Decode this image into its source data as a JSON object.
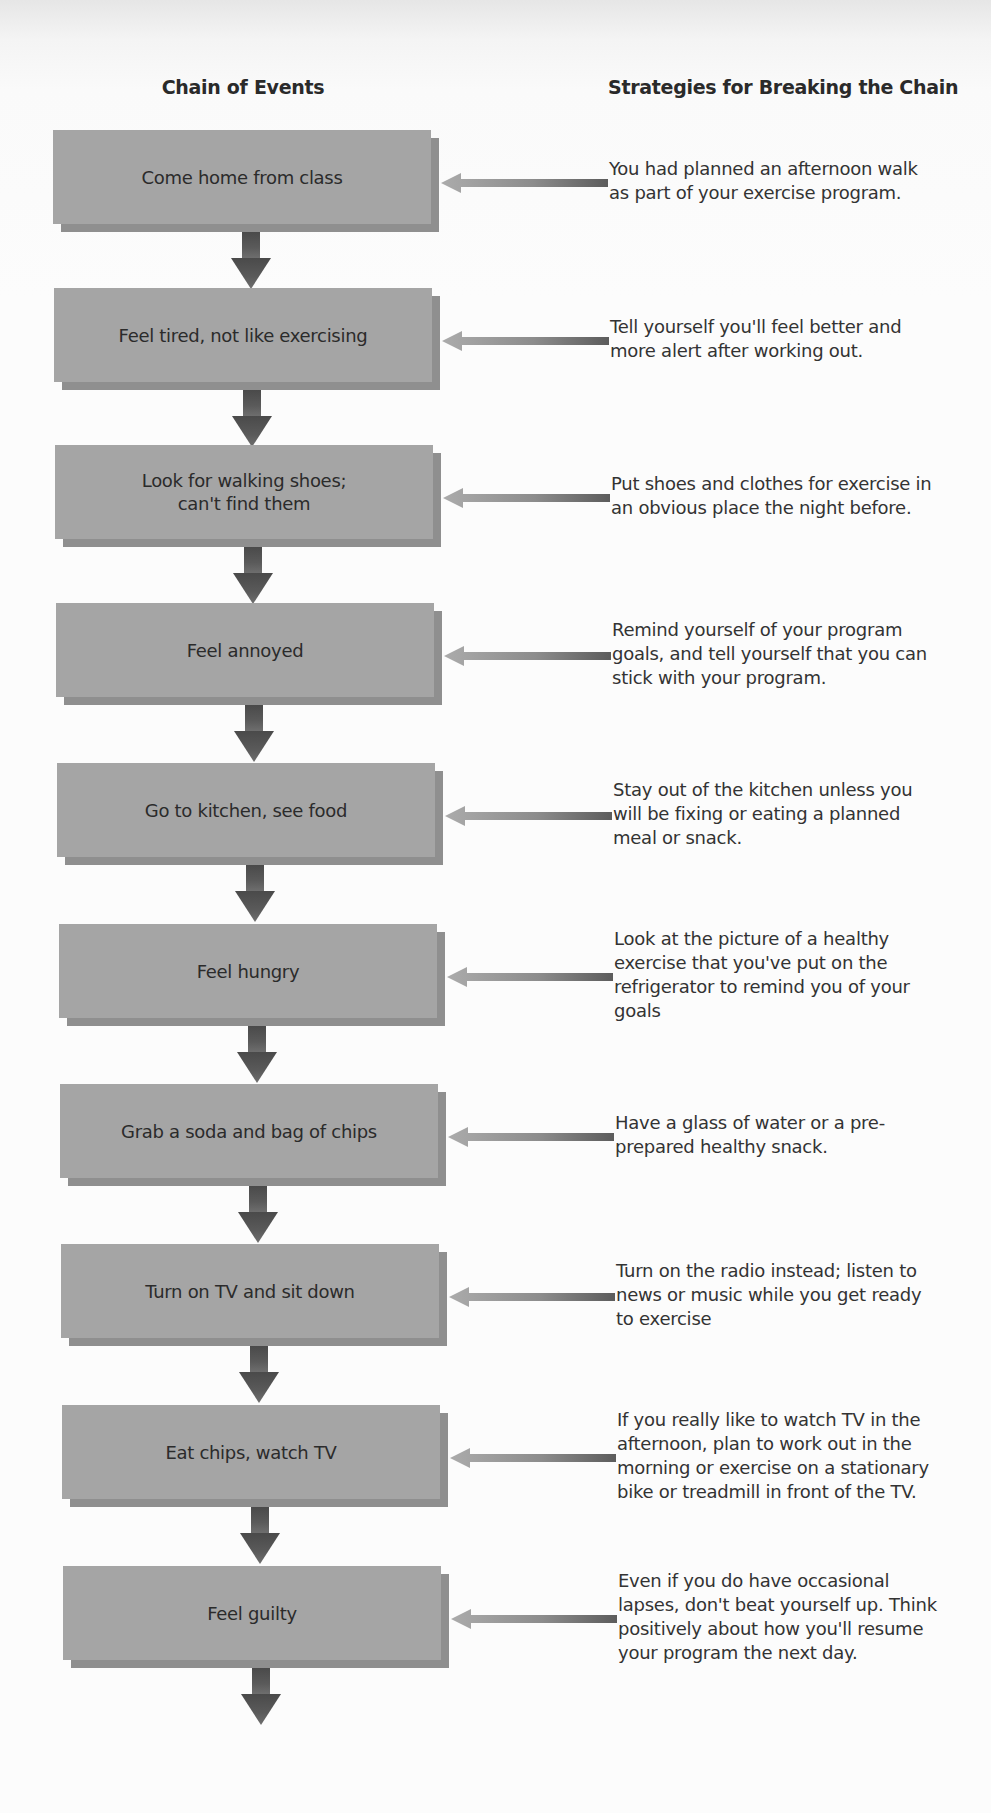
{
  "headers": {
    "chain": "Chain of Events",
    "strategies": "Strategies for Breaking the Chain"
  },
  "colors": {
    "box": "#a5a5a5",
    "box_shadow": "#8f8f8f",
    "down_arrow": "#555555",
    "left_arrow_head": "#a8a8a8",
    "left_arrow_tail": "#5e5e5e",
    "text": "#2e2e2e"
  },
  "steps": [
    {
      "event": "Come home from class",
      "strategy": "You had planned an afternoon walk\nas part of your exercise program."
    },
    {
      "event": "Feel tired, not like exercising",
      "strategy": "Tell yourself you'll feel better and\nmore alert after working out."
    },
    {
      "event": "Look for walking shoes;\ncan't find them",
      "strategy": "Put shoes and clothes for exercise in\nan obvious place the night before."
    },
    {
      "event": "Feel annoyed",
      "strategy": "Remind yourself of your program\ngoals, and tell yourself that you can\nstick with your program."
    },
    {
      "event": "Go to kitchen, see food",
      "strategy": "Stay out of the kitchen unless you\nwill be fixing or eating a planned\nmeal or snack."
    },
    {
      "event": "Feel hungry",
      "strategy": "Look at the picture of a healthy\nexercise that you've put on the\nrefrigerator to remind you of your\ngoals"
    },
    {
      "event": "Grab a soda and bag of chips",
      "strategy": "Have a glass of water or a pre-\nprepared healthy snack."
    },
    {
      "event": "Turn on TV and sit down",
      "strategy": "Turn on the radio instead; listen to\nnews or music while you get ready\nto exercise"
    },
    {
      "event": "Eat chips, watch TV",
      "strategy": "If you really like to watch TV in the\nafternoon, plan to work out in the\nmorning or exercise on a stationary\nbike or treadmill in front of the TV."
    },
    {
      "event": "Feel guilty",
      "strategy": "Even if you do have occasional\nlapses, don't beat yourself up. Think\npositively about how you'll resume\nyour program the next day."
    }
  ]
}
